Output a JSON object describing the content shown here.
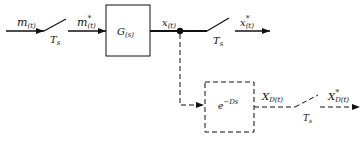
{
  "diagram": {
    "type": "block-diagram",
    "colors": {
      "stroke": "#111111",
      "background": "#ffffff"
    },
    "signals": {
      "input": {
        "base": "m",
        "sub": "(t)"
      },
      "sampled_input": {
        "base": "m",
        "sup": "*",
        "sub": "(t)"
      },
      "output": {
        "base": "x",
        "sub": "(t)"
      },
      "sampled_output": {
        "base": "x",
        "sup": "*",
        "sub": "(t)"
      },
      "delayed_output": {
        "base": "X",
        "sub": "D(t)"
      },
      "sampled_delayed_output": {
        "base": "X",
        "sup": "*",
        "sub": "D(t)"
      }
    },
    "blocks": {
      "plant": {
        "base": "G",
        "sub": "(s)"
      },
      "delay": {
        "base": "e",
        "sup": "−Ds"
      }
    },
    "samplers": [
      {
        "label_base": "T",
        "label_sub": "s"
      },
      {
        "label_base": "T",
        "label_sub": "s"
      },
      {
        "label_base": "T",
        "label_sub": "s"
      }
    ]
  }
}
